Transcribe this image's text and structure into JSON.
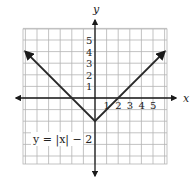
{
  "chart_data": {
    "type": "line",
    "title": "",
    "equation_label": "y = |x| − 2",
    "xlabel": "x",
    "ylabel": "y",
    "x_tick_labels": [
      "1",
      "2",
      "3",
      "4",
      "5"
    ],
    "y_tick_labels": [
      "1",
      "2",
      "3",
      "4",
      "5"
    ],
    "xlim": [
      -6,
      6
    ],
    "ylim": [
      -6,
      6
    ],
    "grid": true,
    "series": [
      {
        "name": "y = |x| − 2",
        "x": [
          -6,
          0,
          6
        ],
        "y": [
          4,
          -2,
          4
        ],
        "arrows_at_ends": true
      }
    ],
    "colors": {
      "line": "#2a2a2a",
      "grid": "#b4b4b4",
      "axis": "#1a1a1a"
    }
  }
}
